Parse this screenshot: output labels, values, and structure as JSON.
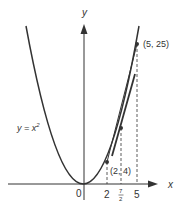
{
  "figure": {
    "curve_label": "y = x²",
    "curve_label_parts": {
      "lhs": "y = x",
      "exp": "2"
    },
    "axis_x_label": "x",
    "axis_y_label": "y",
    "origin_label": "0",
    "points": [
      {
        "label": "(2, 4)",
        "x": 2,
        "y": 4
      },
      {
        "label": "(5, 25)",
        "x": 5,
        "y": 25
      }
    ],
    "midpoint": {
      "x": 3.5,
      "y": 12.25
    },
    "x_ticks": [
      {
        "value": 2,
        "label": "2"
      },
      {
        "value": 3.5,
        "label_num": "7",
        "label_den": "2"
      },
      {
        "value": 5,
        "label": "5"
      }
    ],
    "lines": {
      "secant": {
        "from": [
          2,
          4
        ],
        "to": [
          5,
          25
        ]
      },
      "tangent_at": 3.5
    },
    "colors": {
      "ink": "#333333",
      "background": "#ffffff"
    }
  }
}
